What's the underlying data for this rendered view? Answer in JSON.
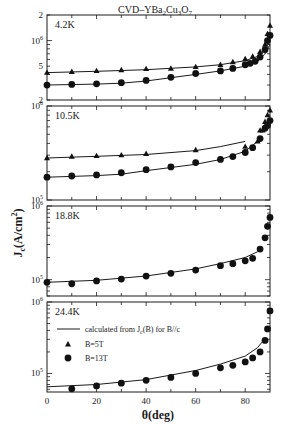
{
  "chart_data": {
    "type": "scatter",
    "title_parts": {
      "pre": "CVD–YBa",
      "s1": "2",
      "mid1": "Cu",
      "s2": "3",
      "mid2": "O",
      "s3": "7"
    },
    "xlabel": "θ(deg)",
    "ylabel": "Jc(A/cm2)",
    "ylabel_parts": {
      "main": "J",
      "sub": "c",
      "rest": "(A/cm",
      "sup": "2",
      "end": ")"
    },
    "xlim": [
      0,
      90
    ],
    "x_ticks": [
      0,
      20,
      40,
      60,
      80
    ],
    "x_tick_labels": [
      "0",
      "20",
      "40",
      "60",
      "80"
    ],
    "yscale": "log",
    "grid": false,
    "legend": {
      "position": "lower panel, upper left",
      "entries": [
        {
          "label_pre": "calculated from J",
          "label_sub": "c",
          "label_post": "(B) for B//c",
          "marker": "line"
        },
        {
          "label": "B=5T",
          "marker": "triangle"
        },
        {
          "label": "B=13T",
          "marker": "circle"
        }
      ]
    },
    "panels": [
      {
        "label": "4.2K",
        "ylim": [
          200000,
          2000000
        ],
        "y_tick_labels": [
          {
            "value": 2000000,
            "text": "2"
          },
          {
            "value": 1000000,
            "text": "10",
            "sup": "6"
          },
          {
            "value": 500000,
            "text": "5"
          },
          {
            "value": 200000,
            "text": "2"
          }
        ],
        "series": [
          {
            "name": "B=5T",
            "marker": "triangle",
            "x": [
              0,
              10,
              20,
              30,
              40,
              50,
              60,
              70,
              75,
              80,
              83,
              86,
              88,
              89,
              90
            ],
            "y": [
              420000,
              430000,
              440000,
              450000,
              465000,
              470000,
              490000,
              520000,
              560000,
              610000,
              650000,
              740000,
              900000,
              1200000,
              1500000
            ]
          },
          {
            "name": "B=13T",
            "marker": "circle",
            "x": [
              0,
              10,
              20,
              30,
              40,
              50,
              60,
              70,
              75,
              80,
              82,
              84,
              86,
              88,
              89,
              90
            ],
            "y": [
              300000,
              305000,
              310000,
              320000,
              340000,
              370000,
              410000,
              440000,
              470000,
              520000,
              540000,
              570000,
              640000,
              780000,
              1000000,
              1150000
            ]
          },
          {
            "name": "calc B=5T",
            "marker": "line",
            "x": [
              0,
              20,
              40,
              60,
              70,
              80,
              85,
              88,
              90
            ],
            "y": [
              420000,
              435000,
              455000,
              490000,
              520000,
              580000,
              650000,
              780000,
              1000000
            ]
          },
          {
            "name": "calc B=13T",
            "marker": "line",
            "x": [
              0,
              20,
              30,
              40,
              60,
              70,
              80,
              85,
              88,
              90
            ],
            "y": [
              300000,
              308000,
              315000,
              335000,
              400000,
              440000,
              500000,
              570000,
              700000,
              900000
            ]
          }
        ]
      },
      {
        "label": "10.5K",
        "ylim": [
          100000,
          1000000
        ],
        "y_tick_labels": [
          {
            "value": 1000000,
            "text": "10",
            "sup": "6"
          },
          {
            "value": 100000,
            "text": "10",
            "sup": "5"
          }
        ],
        "series": [
          {
            "name": "B=5T",
            "marker": "triangle",
            "x": [
              0,
              10,
              20,
              30,
              40,
              60,
              80,
              85,
              86,
              87,
              88,
              89,
              90
            ],
            "y": [
              280000,
              290000,
              295000,
              300000,
              310000,
              340000,
              370000,
              420000,
              550000,
              550000,
              680000,
              800000,
              900000
            ]
          },
          {
            "name": "B=13T",
            "marker": "circle",
            "x": [
              0,
              10,
              20,
              30,
              40,
              50,
              60,
              70,
              75,
              80,
              83,
              86,
              88,
              89,
              90
            ],
            "y": [
              175000,
              180000,
              185000,
              195000,
              210000,
              225000,
              250000,
              270000,
              290000,
              320000,
              360000,
              450000,
              580000,
              620000,
              700000
            ]
          },
          {
            "name": "calc B=5T",
            "marker": "line",
            "x": [
              0,
              20,
              40,
              60,
              70,
              80
            ],
            "y": [
              280000,
              292000,
              305000,
              335000,
              370000,
              420000
            ]
          },
          {
            "name": "calc B=13T",
            "marker": "line",
            "x": [
              0,
              20,
              30,
              40,
              60,
              70,
              80,
              85
            ],
            "y": [
              175000,
              182000,
              188000,
              205000,
              240000,
              270000,
              330000,
              420000
            ]
          }
        ]
      },
      {
        "label": "18.8K",
        "ylim": [
          60000,
          1000000
        ],
        "y_tick_labels": [
          {
            "value": 1000000,
            "text": "10",
            "sup": "6"
          },
          {
            "value": 100000,
            "text": "10",
            "sup": "5"
          }
        ],
        "series": [
          {
            "name": "B=13T",
            "marker": "circle",
            "x": [
              0,
              10,
              20,
              30,
              40,
              50,
              60,
              70,
              75,
              80,
              83,
              86,
              88,
              89,
              90
            ],
            "y": [
              92000,
              88000,
              96000,
              102000,
              112000,
              122000,
              135000,
              155000,
              165000,
              180000,
              195000,
              260000,
              370000,
              530000,
              700000
            ]
          },
          {
            "name": "calc B=13T",
            "marker": "line",
            "x": [
              0,
              20,
              40,
              60,
              70,
              80,
              85,
              87
            ],
            "y": [
              92000,
              98000,
              112000,
              140000,
              165000,
              200000,
              240000,
              270000
            ]
          }
        ]
      },
      {
        "label": "24.4K",
        "ylim": [
          55000,
          1000000
        ],
        "y_tick_labels": [
          {
            "value": 1000000,
            "text": "10",
            "sup": "6"
          },
          {
            "value": 100000,
            "text": "10",
            "sup": "5"
          }
        ],
        "series": [
          {
            "name": "B=13T",
            "marker": "circle",
            "x": [
              10,
              20,
              30,
              40,
              50,
              60,
              70,
              75,
              80,
              83,
              86,
              88,
              89,
              90
            ],
            "y": [
              61000,
              67000,
              73000,
              80000,
              88000,
              100000,
              120000,
              130000,
              145000,
              165000,
              200000,
              290000,
              420000,
              750000
            ]
          },
          {
            "name": "calc B=13T",
            "marker": "line",
            "x": [
              0,
              20,
              40,
              60,
              70,
              80,
              85,
              87
            ],
            "y": [
              65000,
              70000,
              82000,
              110000,
              135000,
              175000,
              230000,
              280000
            ]
          }
        ]
      }
    ]
  }
}
